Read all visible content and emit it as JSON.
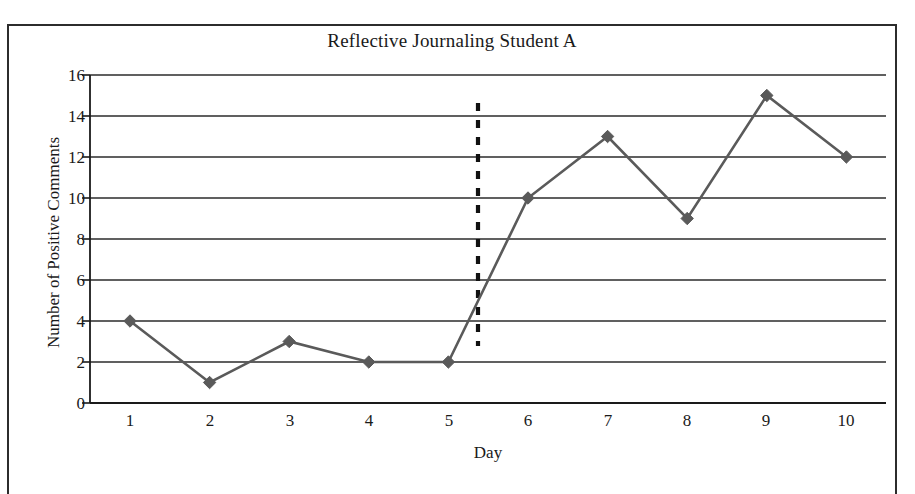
{
  "figure": {
    "title": "Reflective Journaling Student A",
    "frame_color": "#2c2c2c",
    "background": "#ffffff"
  },
  "chart_data": {
    "type": "line",
    "title": "Reflective Journaling Student A",
    "xlabel": "Day",
    "ylabel": "Number of Positive Comments",
    "categories": [
      "1",
      "2",
      "3",
      "4",
      "5",
      "6",
      "7",
      "8",
      "9",
      "10"
    ],
    "x": [
      1,
      2,
      3,
      4,
      5,
      6,
      7,
      8,
      9,
      10
    ],
    "values": [
      4,
      1,
      3,
      2,
      2,
      10,
      13,
      9,
      15,
      12
    ],
    "series": [
      {
        "name": "Number of Positive Comments",
        "values": [
          4,
          1,
          3,
          2,
          2,
          10,
          13,
          9,
          15,
          12
        ],
        "line_color": "#5a5a5a",
        "marker": "diamond",
        "marker_color": "#5a5a5a"
      }
    ],
    "xlim": [
      0.5,
      10.5
    ],
    "ylim": [
      0,
      16
    ],
    "ytick_labels": [
      "0",
      "2",
      "4",
      "6",
      "8",
      "10",
      "12",
      "14",
      "16"
    ],
    "ytick_values": [
      0,
      2,
      4,
      6,
      8,
      10,
      12,
      14,
      16
    ],
    "xtick_labels": [
      "1",
      "2",
      "3",
      "4",
      "5",
      "6",
      "7",
      "8",
      "9",
      "10"
    ],
    "grid": "horizontal",
    "grid_color": "#2b2b2b",
    "legend": "none",
    "annotations": [
      {
        "type": "phase-change-line",
        "name": "phase-change-line",
        "style": "dashed-vertical",
        "color": "#111111",
        "x_position": 5.35,
        "y_from": 2.8,
        "y_to": 16.0,
        "label": ""
      }
    ]
  },
  "axes": {
    "y_label": "Number of Positive Comments",
    "x_label": "Day",
    "y_ticks": [
      "16",
      "14",
      "12",
      "10",
      "8",
      "6",
      "4",
      "2",
      "0"
    ],
    "x_ticks": [
      "1",
      "2",
      "3",
      "4",
      "5",
      "6",
      "7",
      "8",
      "9",
      "10"
    ]
  }
}
